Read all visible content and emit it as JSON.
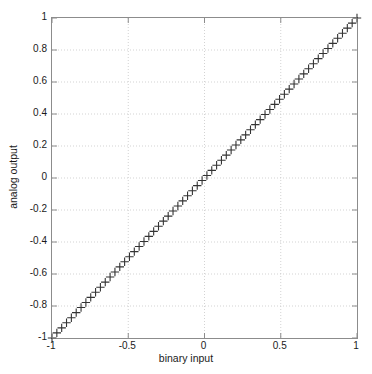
{
  "chart_data": {
    "type": "scatter",
    "title": "",
    "subtitle": "",
    "xlabel": "binary input",
    "ylabel": "analog output",
    "xlim": [
      -1,
      1
    ],
    "ylim": [
      -1,
      1
    ],
    "xticks": [
      -1,
      -0.5,
      0,
      0.5,
      1
    ],
    "xticklabels": [
      "-1",
      "-0.5",
      "0",
      "0.5",
      "1"
    ],
    "yticks": [
      -1,
      -0.8,
      -0.6,
      -0.4,
      -0.2,
      0,
      0.2,
      0.4,
      0.6,
      0.8,
      1
    ],
    "yticklabels": [
      "-1",
      "-0.8",
      "-0.6",
      "-0.4",
      "-0.2",
      "0",
      "0.2",
      "0.4",
      "0.6",
      "0.8",
      "1"
    ],
    "grid": true,
    "grid_style": "dotted",
    "grid_color": "#c8c8c8",
    "legend": null,
    "legend_position": "none",
    "marker": "+",
    "marker_color": "#333333",
    "marker_size": 4.2,
    "axis_color": "#8c8c8c",
    "background": "#ffffff",
    "series": [
      {
        "name": "dac-transfer",
        "marker": "+",
        "color": "#333333",
        "x": [
          -1,
          -0.968254,
          -0.936508,
          -0.904762,
          -0.873016,
          -0.84127,
          -0.809524,
          -0.777778,
          -0.746032,
          -0.714286,
          -0.68254,
          -0.650794,
          -0.619048,
          -0.587302,
          -0.555556,
          -0.52381,
          -0.492063,
          -0.460317,
          -0.428571,
          -0.396825,
          -0.365079,
          -0.333333,
          -0.301587,
          -0.269841,
          -0.238095,
          -0.206349,
          -0.174603,
          -0.142857,
          -0.111111,
          -0.079365,
          -0.047619,
          -0.015873,
          0.015873,
          0.047619,
          0.079365,
          0.111111,
          0.142857,
          0.174603,
          0.206349,
          0.238095,
          0.269841,
          0.301587,
          0.333333,
          0.365079,
          0.396825,
          0.428571,
          0.460317,
          0.492063,
          0.52381,
          0.555556,
          0.587302,
          0.619048,
          0.650794,
          0.68254,
          0.714286,
          0.746032,
          0.777778,
          0.809524,
          0.84127,
          0.873016,
          0.904762,
          0.936508,
          0.968254,
          1
        ],
        "y": [
          -1,
          -0.968254,
          -0.936508,
          -0.904762,
          -0.873016,
          -0.84127,
          -0.809524,
          -0.777778,
          -0.746032,
          -0.714286,
          -0.68254,
          -0.650794,
          -0.619048,
          -0.587302,
          -0.555556,
          -0.52381,
          -0.492063,
          -0.460317,
          -0.428571,
          -0.396825,
          -0.365079,
          -0.333333,
          -0.301587,
          -0.269841,
          -0.238095,
          -0.206349,
          -0.174603,
          -0.142857,
          -0.111111,
          -0.079365,
          -0.047619,
          -0.015873,
          0.015873,
          0.047619,
          0.079365,
          0.111111,
          0.142857,
          0.174603,
          0.206349,
          0.238095,
          0.269841,
          0.301587,
          0.333333,
          0.365079,
          0.396825,
          0.428571,
          0.460317,
          0.492063,
          0.52381,
          0.555556,
          0.587302,
          0.619048,
          0.650794,
          0.68254,
          0.714286,
          0.746032,
          0.777778,
          0.809524,
          0.84127,
          0.873016,
          0.904762,
          0.936508,
          0.968254,
          1
        ]
      }
    ]
  }
}
